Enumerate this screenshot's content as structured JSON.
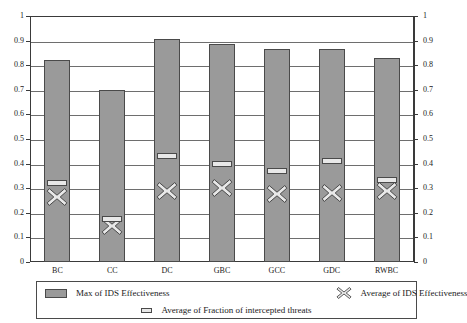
{
  "header": {
    "ghost_text": ""
  },
  "chart_data": {
    "type": "bar",
    "title": "",
    "xlabel": "",
    "ylabel": "",
    "ylim": [
      0,
      1
    ],
    "y_ticks": [
      "0",
      "0.1",
      "0.2",
      "0.3",
      "0.4",
      "0.5",
      "0.6",
      "0.7",
      "0.8",
      "0.9",
      "1"
    ],
    "y_tick_values": [
      0,
      0.1,
      0.2,
      0.3,
      0.4,
      0.5,
      0.6,
      0.7,
      0.8,
      0.9,
      1
    ],
    "right_axis_ticks": [
      "0",
      "0.1",
      "0.2",
      "0.3",
      "0.4",
      "0.5",
      "0.6",
      "0.7",
      "0.8",
      "0.9",
      "1"
    ],
    "grid": true,
    "legend_position": "bottom",
    "categories": [
      "BC",
      "CC",
      "DC",
      "GBC",
      "GCC",
      "GDC",
      "RWBC"
    ],
    "series": [
      {
        "name": "Max of IDS Effectiveness",
        "marker": "bar",
        "color": "#9a9a9a",
        "values": [
          0.82,
          0.7,
          0.905,
          0.885,
          0.867,
          0.867,
          0.83
        ]
      },
      {
        "name": "Average of IDS Effectiveness",
        "marker": "x",
        "color": "#e8e8e8",
        "values": [
          0.265,
          0.148,
          0.29,
          0.3,
          0.278,
          0.282,
          0.288
        ]
      },
      {
        "name": "Average of Fraction of intercepted threats",
        "marker": "dash",
        "color": "#e8e8e8",
        "values": [
          0.32,
          0.175,
          0.43,
          0.4,
          0.37,
          0.412,
          0.333
        ]
      }
    ]
  },
  "legend": {
    "items": [
      {
        "label": "Max of IDS Effectiveness",
        "icon": "bar-swatch-icon"
      },
      {
        "label": "Average of IDS Effectiveness",
        "icon": "x-marker-icon"
      },
      {
        "label": "Average of Fraction of intercepted threats",
        "icon": "dash-marker-icon"
      }
    ]
  }
}
